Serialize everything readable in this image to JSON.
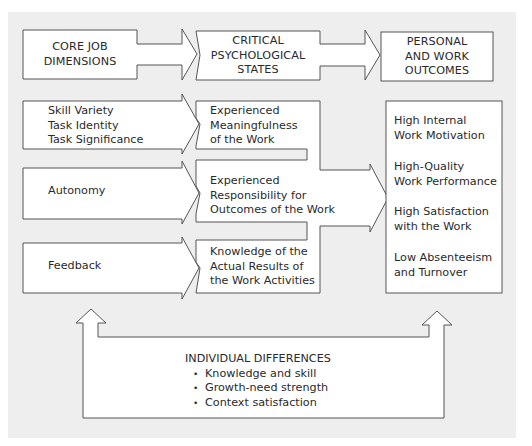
{
  "colors": {
    "background": "#eeeeee",
    "shape_fill": "#ffffff",
    "shape_stroke": "#555555",
    "text": "#2a2a2a"
  },
  "headers": {
    "core": [
      "CORE JOB",
      "DIMENSIONS"
    ],
    "states": [
      "CRITICAL",
      "PSYCHOLOGICAL",
      "STATES"
    ],
    "outcomes": [
      "PERSONAL",
      "AND WORK",
      "OUTCOMES"
    ]
  },
  "dimensions": [
    {
      "lines": [
        "Skill Variety",
        "Task Identity",
        "Task Significance"
      ]
    },
    {
      "lines": [
        "Autonomy"
      ]
    },
    {
      "lines": [
        "Feedback"
      ]
    }
  ],
  "states": [
    {
      "lines": [
        "Experienced",
        "Meaningfulness",
        "of the Work"
      ]
    },
    {
      "lines": [
        "Experienced",
        "Responsibility for",
        "Outcomes of the Work"
      ]
    },
    {
      "lines": [
        "Knowledge of the",
        "Actual Results of",
        "the Work Activities"
      ]
    }
  ],
  "outcomes": [
    {
      "lines": [
        "High Internal",
        "Work Motivation"
      ]
    },
    {
      "lines": [
        "High-Quality",
        "Work Performance"
      ]
    },
    {
      "lines": [
        "High Satisfaction",
        "with the Work"
      ]
    },
    {
      "lines": [
        "Low Absenteeism",
        "and Turnover"
      ]
    }
  ],
  "moderator": {
    "title": "INDIVIDUAL DIFFERENCES",
    "items": [
      "Knowledge and skill",
      "Growth-need strength",
      "Context satisfaction"
    ]
  }
}
